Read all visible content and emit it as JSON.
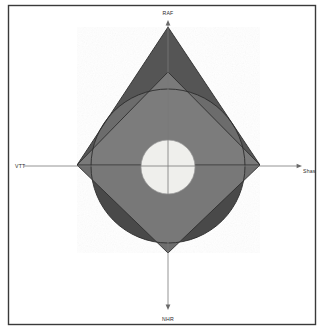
{
  "figure": {
    "background_color": "#ffffff",
    "frame": {
      "stroke_color": "#3a3a3a",
      "fill_color": "#ffffff",
      "x": 8,
      "y": 5,
      "width": 308,
      "height": 320
    },
    "axes": {
      "stroke_color": "#7a7a7a",
      "center_x": 168,
      "center_y": 166,
      "vertical": {
        "top_y": 22,
        "bottom_y": 308
      },
      "horizontal": {
        "left_x": 24,
        "right_x": 300
      },
      "labels": {
        "top": "RAF",
        "bottom": "NHR",
        "left": "VTT",
        "right": "Shas"
      }
    },
    "shapes": {
      "outer_circle": {
        "name": "outer-circle",
        "center_x": 168,
        "center_y": 166,
        "radius": 77,
        "fill_color": "#4a4a4a"
      },
      "diamond": {
        "name": "diamond",
        "fill_color": "#6e6e6e",
        "vertices": [
          {
            "x": 168,
            "y": 72
          },
          {
            "x": 260,
            "y": 165
          },
          {
            "x": 168,
            "y": 253
          },
          {
            "x": 77,
            "y": 165
          }
        ]
      },
      "triangle": {
        "name": "triangle",
        "fill_color": "#555555",
        "vertices": [
          {
            "x": 168,
            "y": 27
          },
          {
            "x": 260,
            "y": 165
          },
          {
            "x": 77,
            "y": 165
          }
        ]
      },
      "inner_circle": {
        "name": "inner-circle",
        "center_x": 168,
        "center_y": 167,
        "radius": 27,
        "fill_color": "#efefec"
      }
    },
    "palette": {
      "circle_only": "#4a4a4a",
      "triangle_only": "#555555",
      "overlap_light": "#787878",
      "core": "#efefec",
      "outline": "#2e2e2e"
    }
  },
  "chart_data": {
    "type": "diagram",
    "xlabel": "",
    "ylabel": "",
    "axis_labels": {
      "up": "RAF",
      "down": "NHR",
      "left": "VTT",
      "right": "Shas"
    },
    "elements": [
      {
        "shape": "circle",
        "label": "outer-circle",
        "center": [
          168,
          166
        ],
        "radius": 77,
        "fill": "#4a4a4a"
      },
      {
        "shape": "polygon",
        "label": "diamond",
        "points": [
          [
            168,
            72
          ],
          [
            260,
            165
          ],
          [
            168,
            253
          ],
          [
            77,
            165
          ]
        ],
        "fill": "#6e6e6e"
      },
      {
        "shape": "polygon",
        "label": "triangle",
        "points": [
          [
            168,
            27
          ],
          [
            260,
            165
          ],
          [
            77,
            165
          ]
        ],
        "fill": "#555555"
      },
      {
        "shape": "circle",
        "label": "inner-circle",
        "center": [
          168,
          167
        ],
        "radius": 27,
        "fill": "#efefec"
      }
    ],
    "legend": [],
    "grid": false
  }
}
